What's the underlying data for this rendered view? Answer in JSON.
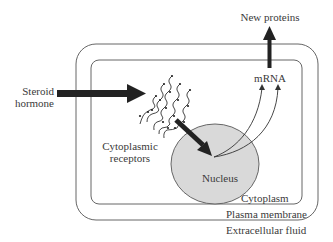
{
  "diagram": {
    "labels": {
      "steroid_hormone_line1": "Steroid",
      "steroid_hormone_line2": "hormone",
      "cytoplasmic_receptors_line1": "Cytoplasmic",
      "cytoplasmic_receptors_line2": "receptors",
      "nucleus": "Nucleus",
      "mrna": "mRNA",
      "new_proteins": "New proteins",
      "cytoplasm": "Cytoplasm",
      "plasma_membrane": "Plasma membrane",
      "extracellular_fluid": "Extracellular fluid"
    },
    "colors": {
      "outline": "#555555",
      "arrow": "#222222",
      "nucleus_fill": "#d9d9d9",
      "text": "#3a3a3a"
    },
    "flow": [
      "Steroid hormone",
      "Cytoplasmic receptors",
      "Nucleus",
      "mRNA",
      "New proteins"
    ]
  }
}
